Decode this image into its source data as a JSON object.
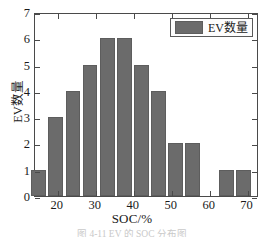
{
  "figure": {
    "caption": "图 4-11  EV 的 SOC 分布图"
  },
  "legend": {
    "label": "EV数量",
    "swatch_color": "#6b6b6b",
    "position": "top-right"
  },
  "axes": {
    "x_title": "SOC/%",
    "y_title": "EV数量",
    "y_ticks": [
      "0",
      "1",
      "2",
      "3",
      "4",
      "5",
      "6",
      "7"
    ],
    "x_ticks": [
      "20",
      "30",
      "40",
      "50",
      "60",
      "70"
    ]
  },
  "chart_data": {
    "type": "bar",
    "title": "",
    "subtitle": "",
    "xlabel": "SOC/%",
    "ylabel": "EV数量",
    "xlim": [
      14,
      73
    ],
    "ylim": [
      0,
      7
    ],
    "grid": false,
    "legend_position": "top-right",
    "bar_color": "#6b6b6b",
    "bin_width": 4.5,
    "categories": [
      "15",
      "19.5",
      "24",
      "28.5",
      "33",
      "37.5",
      "42",
      "46.5",
      "51",
      "55.5",
      "60",
      "64.5",
      "69"
    ],
    "bin_centers": [
      15,
      19.5,
      24,
      28.5,
      33,
      37.5,
      42,
      46.5,
      51,
      55.5,
      60,
      64.5,
      69
    ],
    "values": [
      1,
      3,
      4,
      5,
      6,
      6,
      5,
      4,
      2,
      2,
      0,
      1,
      1
    ],
    "series": [
      {
        "name": "EV数量",
        "values": [
          1,
          3,
          4,
          5,
          6,
          6,
          5,
          4,
          2,
          2,
          0,
          1,
          1
        ]
      }
    ],
    "annotations": []
  }
}
